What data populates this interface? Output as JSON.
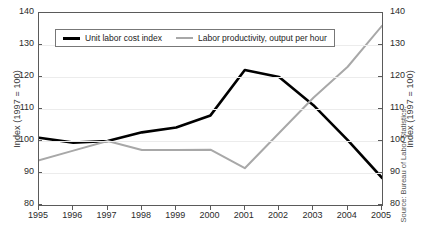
{
  "chart_data": {
    "type": "line",
    "title": "",
    "xlabel": "",
    "ylabel": "Index (1997 = 100)",
    "ylabel_right": "Index (1997 = 100)",
    "ylim": [
      80,
      140
    ],
    "yticks": [
      80,
      90,
      100,
      110,
      120,
      130,
      140
    ],
    "yticks_right": [
      80,
      90,
      100,
      110,
      120,
      130,
      140
    ],
    "xlim": [
      1995,
      2005
    ],
    "categories": [
      "1995",
      "1996",
      "1997",
      "1998",
      "1999",
      "2000",
      "2001",
      "2002",
      "2003",
      "2004",
      "2005"
    ],
    "x": [
      1995,
      1996,
      1997,
      1998,
      1999,
      2000,
      2001,
      2002,
      2003,
      2004,
      2005
    ],
    "grid": true,
    "legend_position": "upper-left-inside",
    "series": [
      {
        "name": "Unit labor cost index",
        "color": "#000000",
        "width": 2.6,
        "values": [
          101.0,
          99.5,
          100.0,
          102.7,
          104.2,
          108.0,
          122.2,
          120.0,
          111.2,
          100.3,
          88.5
        ]
      },
      {
        "name": "Labor productivity, output per hour",
        "color": "#a8a8a8",
        "width": 2.0,
        "values": [
          94.0,
          97.0,
          100.0,
          97.2,
          97.2,
          97.3,
          91.5,
          102.5,
          113.5,
          123.2,
          136.0
        ]
      }
    ],
    "source": "Source: Bureau of Labor Statistics."
  },
  "legend": {
    "items": [
      {
        "label": "Unit labor cost index"
      },
      {
        "label": "Labor productivity, output per hour"
      }
    ]
  }
}
